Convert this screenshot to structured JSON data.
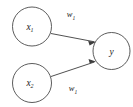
{
  "diagram": {
    "type": "neural-network-node",
    "background_color": "#ffffff",
    "stroke_color": "#3d3d3d",
    "text_color": "#1a1a1a",
    "width": 133,
    "height": 107,
    "nodes": [
      {
        "id": "x1",
        "label": "x",
        "subscript": "1",
        "role": "input",
        "cx": 32,
        "cy": 26.5,
        "r": 19.5
      },
      {
        "id": "x2",
        "label": "x",
        "subscript": "2",
        "role": "input",
        "cx": 32,
        "cy": 83,
        "r": 19.5
      },
      {
        "id": "y",
        "label": "y",
        "subscript": "",
        "role": "output",
        "cx": 111.5,
        "cy": 51,
        "r": 18.5
      }
    ],
    "edges": [
      {
        "id": "edge-x1-y",
        "from": "x1",
        "to": "y",
        "label": "w",
        "subscript": "1",
        "label_x": 71,
        "label_y": 17
      },
      {
        "id": "edge-x2-y",
        "from": "x2",
        "to": "y",
        "label": "w",
        "subscript": "1",
        "label_x": 73,
        "label_y": 91
      }
    ]
  }
}
